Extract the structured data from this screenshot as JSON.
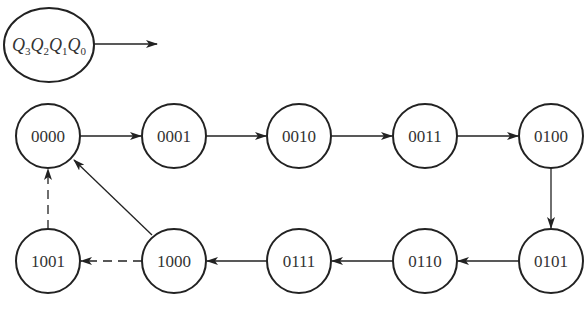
{
  "legend": {
    "label_parts": [
      {
        "var": "Q",
        "sub": "3"
      },
      {
        "var": "Q",
        "sub": "2"
      },
      {
        "var": "Q",
        "sub": "1"
      },
      {
        "var": "Q",
        "sub": "0"
      }
    ]
  },
  "states": [
    {
      "id": "s0",
      "label": "0000"
    },
    {
      "id": "s1",
      "label": "0001"
    },
    {
      "id": "s2",
      "label": "0010"
    },
    {
      "id": "s3",
      "label": "0011"
    },
    {
      "id": "s4",
      "label": "0100"
    },
    {
      "id": "s5",
      "label": "0101"
    },
    {
      "id": "s6",
      "label": "0110"
    },
    {
      "id": "s7",
      "label": "0111"
    },
    {
      "id": "s8",
      "label": "1000"
    },
    {
      "id": "s9",
      "label": "1001"
    }
  ],
  "transitions": [
    {
      "from": "0000",
      "to": "0001",
      "style": "solid"
    },
    {
      "from": "0001",
      "to": "0010",
      "style": "solid"
    },
    {
      "from": "0010",
      "to": "0011",
      "style": "solid"
    },
    {
      "from": "0011",
      "to": "0100",
      "style": "solid"
    },
    {
      "from": "0100",
      "to": "0101",
      "style": "solid"
    },
    {
      "from": "0101",
      "to": "0110",
      "style": "solid"
    },
    {
      "from": "0110",
      "to": "0111",
      "style": "solid"
    },
    {
      "from": "0111",
      "to": "1000",
      "style": "solid"
    },
    {
      "from": "1000",
      "to": "0000",
      "style": "solid"
    },
    {
      "from": "1000",
      "to": "1001",
      "style": "dashed"
    },
    {
      "from": "1001",
      "to": "0000",
      "style": "dashed"
    }
  ],
  "colors": {
    "stroke": "#222222",
    "text": "#333333"
  }
}
